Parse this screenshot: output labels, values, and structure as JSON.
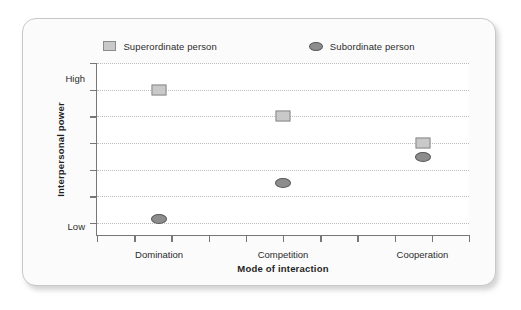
{
  "chart_data": {
    "type": "scatter",
    "title": "",
    "xlabel": "Mode of interaction",
    "ylabel": "Interpersonal power",
    "categories": [
      "Domination",
      "Competition",
      "Cooperation"
    ],
    "x": [
      0.167,
      0.5,
      0.875
    ],
    "ylim": [
      0,
      1
    ],
    "xlim": [
      0,
      1
    ],
    "grid": true,
    "grid_orientation": "horizontal",
    "legend_position": "top-center",
    "y_tick_labels": [
      "High",
      "Low"
    ],
    "y_tick_positions": [
      0.915,
      0.055
    ],
    "y_gridline_positions": [
      1.0,
      0.845,
      0.69,
      0.535,
      0.38,
      0.225,
      0.07
    ],
    "x_tick_positions": [
      0.0,
      0.1,
      0.2,
      0.3,
      0.4,
      0.5,
      0.6,
      0.7,
      0.8,
      0.9,
      1.0
    ],
    "series": [
      {
        "name": "Superordinate person",
        "marker": "square",
        "fill": "#c9c9c9",
        "stroke": "#8a8a8a",
        "points": [
          {
            "category": "Domination",
            "x": 0.167,
            "y": 0.845
          },
          {
            "category": "Competition",
            "x": 0.5,
            "y": 0.69
          },
          {
            "category": "Cooperation",
            "x": 0.875,
            "y": 0.535
          }
        ]
      },
      {
        "name": "Subordinate person",
        "marker": "ellipse",
        "fill": "#8d8d8d",
        "stroke": "#5a5a5a",
        "points": [
          {
            "category": "Domination",
            "x": 0.167,
            "y": 0.095
          },
          {
            "category": "Competition",
            "x": 0.5,
            "y": 0.3
          },
          {
            "category": "Cooperation",
            "x": 0.875,
            "y": 0.455
          }
        ]
      }
    ]
  },
  "legend": {
    "entries": [
      {
        "label": "Superordinate person",
        "marker": "square"
      },
      {
        "label": "Subordinate person",
        "marker": "ellipse"
      }
    ]
  },
  "axes": {
    "y_title": "Interpersonal power",
    "x_title": "Mode of interaction",
    "y_high_label": "High",
    "y_low_label": "Low",
    "x_labels": [
      "Domination",
      "Competition",
      "Cooperation"
    ]
  },
  "colors": {
    "card_background": "#fbfbfb",
    "card_border": "#c8c8c8",
    "plot_background": "#ffffff",
    "axis_line": "#777777",
    "gridline": "#bdbdbd",
    "text": "#2b2b2b",
    "superordinate_fill": "#c9c9c9",
    "superordinate_stroke": "#8a8a8a",
    "subordinate_fill": "#8d8d8d",
    "subordinate_stroke": "#5a5a5a"
  }
}
